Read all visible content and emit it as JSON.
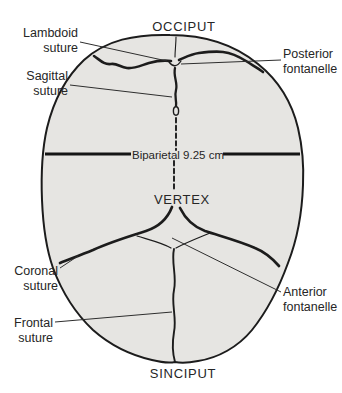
{
  "figure": {
    "cardinal": {
      "top": "OCCIPUT",
      "middle": "VERTEX",
      "bottom": "SINCIPUT"
    },
    "measurement": {
      "label": "Biparietal 9.25 cm",
      "value_cm": "9.25"
    },
    "annotations": {
      "lambdoid": {
        "line1": "Lambdoid",
        "line2": "suture"
      },
      "sagittal": {
        "line1": "Sagittal",
        "line2": "suture"
      },
      "posterior_fontanelle": {
        "line1": "Posterior",
        "line2": "fontanelle"
      },
      "coronal": {
        "line1": "Coronal",
        "line2": "suture"
      },
      "frontal": {
        "line1": "Frontal",
        "line2": "suture"
      },
      "anterior_fontanelle": {
        "line1": "Anterior",
        "line2": "fontanelle"
      }
    },
    "colors": {
      "skull_fill": "#e6e5e2",
      "line": "#1c1c1c",
      "text": "#262626",
      "background": "#ffffff"
    }
  }
}
